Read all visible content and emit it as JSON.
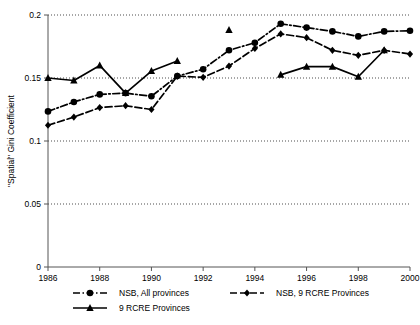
{
  "chart_data": {
    "type": "line",
    "title": "",
    "xlabel": "",
    "ylabel": "\"Spatial\" Gini Coefficient",
    "x": [
      1986,
      1987,
      1988,
      1989,
      1990,
      1991,
      1992,
      1993,
      1994,
      1995,
      1996,
      1997,
      1998,
      1999,
      2000
    ],
    "xlim": [
      1986,
      2000
    ],
    "ylim": [
      0,
      0.2
    ],
    "xticks": [
      "1986",
      "1988",
      "1990",
      "1992",
      "1994",
      "1996",
      "1998",
      "2000"
    ],
    "xtick_values": [
      1986,
      1988,
      1990,
      1992,
      1994,
      1996,
      1998,
      2000
    ],
    "yticks": [
      "0",
      "0.05",
      "0.1",
      "0.15",
      "0.2"
    ],
    "ytick_values": [
      0,
      0.05,
      0.1,
      0.15,
      0.2
    ],
    "grid": "horizontal-dotted",
    "legend_position": "bottom",
    "series": [
      {
        "name": "NSB, All provinces",
        "marker": "circle",
        "linestyle": "dash-dot",
        "color": "#000000",
        "x": [
          1986,
          1987,
          1988,
          1989,
          1990,
          1991,
          1992,
          1993,
          1994,
          1995,
          1996,
          1997,
          1998,
          1999,
          2000
        ],
        "values": [
          0.1235,
          0.131,
          0.137,
          0.138,
          0.1355,
          0.1515,
          0.157,
          0.172,
          0.178,
          0.193,
          0.19,
          0.187,
          0.183,
          0.187,
          0.1875
        ]
      },
      {
        "name": "NSB, 9 RCRE Provinces",
        "marker": "diamond",
        "linestyle": "dashed",
        "color": "#000000",
        "x": [
          1986,
          1987,
          1988,
          1989,
          1990,
          1991,
          1992,
          1993,
          1994,
          1995,
          1996,
          1997,
          1998,
          1999,
          2000
        ],
        "values": [
          0.1125,
          0.119,
          0.1265,
          0.128,
          0.125,
          0.1515,
          0.1505,
          0.1595,
          0.1735,
          0.185,
          0.182,
          0.172,
          0.168,
          0.172,
          0.169
        ]
      },
      {
        "name": "9 RCRE Provinces",
        "marker": "triangle",
        "linestyle": "solid",
        "color": "#000000",
        "segments": [
          {
            "x": [
              1986,
              1987,
              1988,
              1989,
              1990,
              1991
            ],
            "values": [
              0.15,
              0.148,
              0.16,
              0.138,
              0.1555,
              0.1635
            ]
          },
          {
            "x": [
              1995,
              1996,
              1997,
              1998,
              1999
            ],
            "values": [
              0.1525,
              0.159,
              0.159,
              0.151,
              0.172
            ]
          }
        ],
        "isolated_points": [
          {
            "x": 1993,
            "value": 0.188
          }
        ]
      }
    ],
    "legend": [
      {
        "label": "NSB, All provinces",
        "marker": "circle",
        "linestyle": "dash-dot"
      },
      {
        "label": "NSB, 9 RCRE Provinces",
        "marker": "diamond",
        "linestyle": "dashed"
      },
      {
        "label": "9 RCRE Provinces",
        "marker": "triangle",
        "linestyle": "solid"
      }
    ]
  },
  "axis": {
    "y_title": "\"Spatial\" Gini Coefficient"
  }
}
